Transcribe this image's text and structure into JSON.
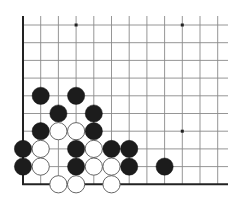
{
  "diagram": {
    "type": "go-board-fragment",
    "corner": "bottom-left",
    "columns": 12,
    "rows": 10,
    "edges": [
      "left",
      "bottom"
    ],
    "star_points": [
      {
        "col": 3,
        "row": 0
      },
      {
        "col": 9,
        "row": 0
      },
      {
        "col": 9,
        "row": 6
      }
    ],
    "stones": [
      {
        "col": 1,
        "row": 4,
        "color": "black"
      },
      {
        "col": 3,
        "row": 4,
        "color": "black"
      },
      {
        "col": 2,
        "row": 5,
        "color": "black"
      },
      {
        "col": 4,
        "row": 5,
        "color": "black"
      },
      {
        "col": 1,
        "row": 6,
        "color": "black"
      },
      {
        "col": 2,
        "row": 6,
        "color": "white"
      },
      {
        "col": 3,
        "row": 6,
        "color": "white"
      },
      {
        "col": 4,
        "row": 6,
        "color": "black"
      },
      {
        "col": 0,
        "row": 7,
        "color": "black"
      },
      {
        "col": 1,
        "row": 7,
        "color": "white"
      },
      {
        "col": 3,
        "row": 7,
        "color": "black"
      },
      {
        "col": 4,
        "row": 7,
        "color": "white"
      },
      {
        "col": 5,
        "row": 7,
        "color": "black"
      },
      {
        "col": 6,
        "row": 7,
        "color": "black"
      },
      {
        "col": 0,
        "row": 8,
        "color": "black"
      },
      {
        "col": 1,
        "row": 8,
        "color": "white"
      },
      {
        "col": 3,
        "row": 8,
        "color": "black"
      },
      {
        "col": 4,
        "row": 8,
        "color": "white"
      },
      {
        "col": 5,
        "row": 8,
        "color": "white"
      },
      {
        "col": 6,
        "row": 8,
        "color": "black"
      },
      {
        "col": 8,
        "row": 8,
        "color": "black"
      },
      {
        "col": 2,
        "row": 9,
        "color": "white"
      },
      {
        "col": 3,
        "row": 9,
        "color": "white"
      },
      {
        "col": 5,
        "row": 9,
        "color": "white"
      }
    ],
    "colors": {
      "background": "#ffffff",
      "grid": "#8a8a8a",
      "edge": "#222222",
      "black_stone": "#1c1c1c",
      "white_stone": "#ffffff",
      "white_outline": "#555555"
    },
    "counts": {
      "black": 15,
      "white": 9
    }
  }
}
